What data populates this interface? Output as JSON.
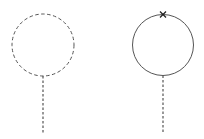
{
  "diagram": {
    "background": "#ffffff",
    "stroke_color": "#555555",
    "figures": [
      {
        "name": "dashed-circle-with-stem",
        "circle": {
          "cx": 43,
          "cy": 45,
          "r": 31,
          "style": "dashed"
        },
        "stem": {
          "x": 43,
          "y1": 76,
          "y2": 133,
          "style": "dashed"
        },
        "marker": null
      },
      {
        "name": "solid-circle-with-stem-and-x",
        "circle": {
          "cx": 163,
          "cy": 45,
          "r": 30.5,
          "style": "solid"
        },
        "stem": {
          "x": 163,
          "y1": 75.5,
          "y2": 133,
          "style": "dashed"
        },
        "marker": {
          "type": "x",
          "cx": 163,
          "cy": 14.5,
          "size": 3
        }
      }
    ]
  }
}
